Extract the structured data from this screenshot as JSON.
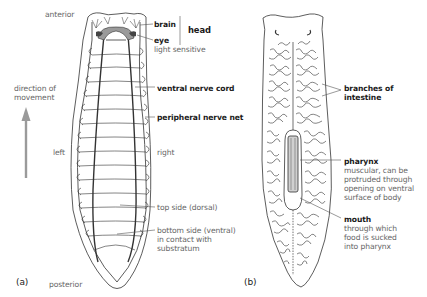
{
  "figure": {
    "panels": [
      {
        "id": "a",
        "label": "(a)",
        "orientation": {
          "anterior": "anterior",
          "posterior": "posterior",
          "left": "left",
          "right": "right",
          "movement": [
            "direction of",
            "movement"
          ]
        },
        "annotations": {
          "brain": "brain",
          "head": "head",
          "eye": "eye",
          "eye_note": "light sensitive",
          "ventral_nerve_cord": "ventral nerve cord",
          "peripheral_nerve_net": "peripheral nerve net",
          "dorsal": "top side (dorsal)",
          "ventral": [
            "bottom side (ventral)",
            "in contact with",
            "substratum"
          ]
        }
      },
      {
        "id": "b",
        "label": "(b)",
        "annotations": {
          "intestine": [
            "branches of",
            "intestine"
          ],
          "pharynx": "pharynx",
          "pharynx_note": [
            "muscular, can be",
            "protruded through",
            "opening on ventral",
            "surface of body"
          ],
          "mouth": "mouth",
          "mouth_note": [
            "through which",
            "food is sucked",
            "into pharynx"
          ]
        }
      }
    ],
    "colors": {
      "line": "#333333",
      "arrow": "#9a9a9a",
      "brain_fill": "#9a9a9a",
      "text_bold": "#1a1a1a",
      "text_light": "#666666"
    }
  }
}
